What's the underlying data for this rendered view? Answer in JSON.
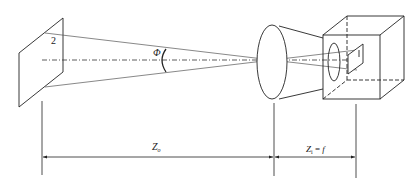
{
  "diagram": {
    "labels": {
      "object_plane_number": "2",
      "angle_symbol": "Φ",
      "object_distance": "Z",
      "object_distance_sub": "o",
      "image_distance": "Z",
      "image_distance_sub": "i",
      "image_distance_eq": " = ",
      "focal_length": "f"
    },
    "colors": {
      "stroke": "#222222",
      "ray": "#555555",
      "background": "#ffffff"
    }
  }
}
